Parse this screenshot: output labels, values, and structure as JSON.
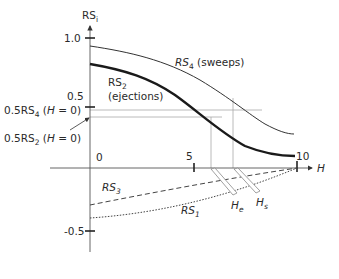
{
  "diagram": {
    "y_axis": {
      "label": "RS",
      "label_sub": "i",
      "ticks": [
        {
          "value": "1.0"
        },
        {
          "value": "0.5"
        },
        {
          "value": "0"
        },
        {
          "value": "-0.5"
        }
      ]
    },
    "x_axis": {
      "label": "H",
      "ticks": [
        {
          "value": "5"
        },
        {
          "value": "10"
        }
      ]
    },
    "curves": {
      "rs4": {
        "name": "RS",
        "sub": "4",
        "desc": "(sweeps)",
        "style": "thin solid"
      },
      "rs2": {
        "name": "RS",
        "sub": "2",
        "desc": "(ejections)",
        "style": "thick solid"
      },
      "rs3": {
        "name": "RS",
        "sub": "3",
        "style": "dashed"
      },
      "rs1": {
        "name": "RS",
        "sub": "1",
        "style": "dotted"
      }
    },
    "annotations": {
      "half_rs4": {
        "prefix": "0.5RS",
        "sub": "4",
        "open": " (",
        "var": "H",
        "rest": " = 0)"
      },
      "half_rs2": {
        "prefix": "0.5RS",
        "sub": "2",
        "open": " (",
        "var": "H",
        "rest": " = 0)"
      },
      "he": {
        "name": "H",
        "sub": "e"
      },
      "hs": {
        "name": "H",
        "sub": "s"
      }
    },
    "colors": {
      "axis": "#555555",
      "curve": "#1a1a1a",
      "guide": "#9a9a9a"
    }
  }
}
